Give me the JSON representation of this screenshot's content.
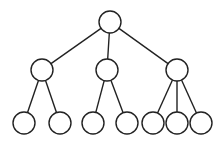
{
  "diagram": {
    "type": "tree",
    "nodes": [
      {
        "id": "root",
        "cx": 110,
        "cy": 22,
        "r": 11
      },
      {
        "id": "a",
        "cx": 42,
        "cy": 70,
        "r": 11
      },
      {
        "id": "b",
        "cx": 107,
        "cy": 70,
        "r": 11
      },
      {
        "id": "c",
        "cx": 177,
        "cy": 70,
        "r": 11
      },
      {
        "id": "a1",
        "cx": 24,
        "cy": 123,
        "r": 11
      },
      {
        "id": "a2",
        "cx": 60,
        "cy": 123,
        "r": 11
      },
      {
        "id": "b1",
        "cx": 93,
        "cy": 123,
        "r": 11
      },
      {
        "id": "b2",
        "cx": 127,
        "cy": 123,
        "r": 11
      },
      {
        "id": "c1",
        "cx": 153,
        "cy": 123,
        "r": 11
      },
      {
        "id": "c2",
        "cx": 177,
        "cy": 123,
        "r": 11
      },
      {
        "id": "c3",
        "cx": 201,
        "cy": 123,
        "r": 11
      }
    ],
    "edges": [
      [
        "root",
        "a"
      ],
      [
        "root",
        "b"
      ],
      [
        "root",
        "c"
      ],
      [
        "a",
        "a1"
      ],
      [
        "a",
        "a2"
      ],
      [
        "b",
        "b1"
      ],
      [
        "b",
        "b2"
      ],
      [
        "c",
        "c1"
      ],
      [
        "c",
        "c2"
      ],
      [
        "c",
        "c3"
      ]
    ]
  }
}
